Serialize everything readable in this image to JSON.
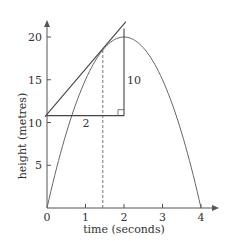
{
  "chart_data": {
    "type": "line",
    "title": "",
    "xlabel": "time (seconds)",
    "ylabel": "height (metres)",
    "xlim": [
      0,
      4.4
    ],
    "ylim": [
      0,
      22
    ],
    "x_ticks": [
      0,
      1,
      2,
      3,
      4
    ],
    "y_ticks": [
      5,
      10,
      15,
      20
    ],
    "x_tick_labels": [
      "0",
      "1",
      "2",
      "3",
      "4"
    ],
    "y_tick_labels": [
      "5",
      "10",
      "15",
      "20"
    ],
    "grid": false,
    "legend": null,
    "series": [
      {
        "name": "height curve h = 20t - 5t^2",
        "x": [
          0,
          0.25,
          0.5,
          0.75,
          1,
          1.25,
          1.5,
          1.75,
          2,
          2.25,
          2.5,
          2.75,
          3,
          3.25,
          3.5,
          3.75,
          4
        ],
        "values": [
          0,
          4.69,
          8.75,
          12.19,
          15,
          17.19,
          18.75,
          19.69,
          20,
          19.69,
          18.75,
          17.19,
          15,
          12.19,
          8.75,
          4.69,
          0
        ]
      },
      {
        "name": "tangent line",
        "x": [
          0,
          2.05
        ],
        "values": [
          10.8,
          21.8
        ]
      }
    ],
    "annotations": [
      {
        "type": "dashed-vertical",
        "x": 1.45,
        "from_y": 0,
        "to_y": 18.5
      },
      {
        "type": "triangle-run",
        "label": "2",
        "from": [
          0,
          10.8
        ],
        "to": [
          2,
          10.8
        ]
      },
      {
        "type": "triangle-rise",
        "label": "10",
        "from": [
          2,
          10.8
        ],
        "to": [
          2,
          21
        ]
      },
      {
        "type": "right-angle-marker",
        "at": [
          2,
          10.8
        ]
      }
    ]
  },
  "labels": {
    "xlabel": "time (seconds)",
    "ylabel": "height (metres)",
    "run": "2",
    "rise": "10"
  }
}
